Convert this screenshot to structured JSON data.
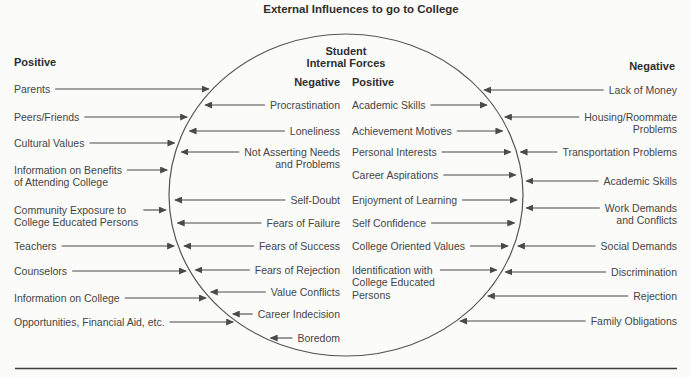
{
  "title": "External Influences to go to College",
  "circle": {
    "label_line1": "Student",
    "label_line2": "Internal Forces",
    "negative": {
      "header": "Negative",
      "items": [
        "Procrastination",
        "Loneliness",
        "Not Asserting Needs\nand Problems",
        "Self-Doubt",
        "Fears of Failure",
        "Fears of Success",
        "Fears of Rejection",
        "Value Conflicts",
        "Career Indecision",
        "Boredom"
      ]
    },
    "positive": {
      "header": "Positive",
      "items": [
        "Academic Skills",
        "Achievement Motives",
        "Personal Interests",
        "Career Aspirations",
        "Enjoyment of Learning",
        "Self Confidence",
        "College Oriented Values",
        "Identification with\nCollege Educated\nPersons"
      ]
    }
  },
  "external": {
    "positive": {
      "header": "Positive",
      "items": [
        "Parents",
        "Peers/Friends",
        "Cultural Values",
        "Information on Benefits\nof Attending College",
        "Community Exposure to\nCollege Educated Persons",
        "Teachers",
        "Counselors",
        "Information on College",
        "Opportunities, Financial Aid, etc."
      ]
    },
    "negative": {
      "header": "Negative",
      "items": [
        "Lack of Money",
        "Housing/Roommate\nProblems",
        "Transportation Problems",
        "Academic Skills",
        "Work Demands\nand Conflicts",
        "Social Demands",
        "Discrimination",
        "Rejection",
        "Family Obligations"
      ]
    }
  },
  "colors": {
    "background": "#fbfbfa",
    "text": "#454545",
    "heading": "#2e2e2e",
    "line": "#4a4a4a"
  }
}
